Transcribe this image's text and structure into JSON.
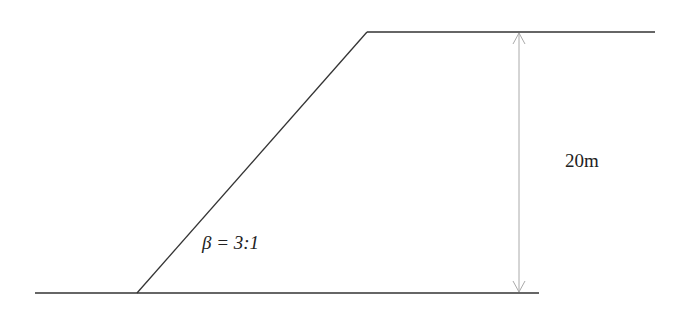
{
  "diagram": {
    "type": "embankment-cross-section",
    "labels": {
      "height": "20m",
      "slope": "β = 3:1"
    },
    "geometry": {
      "ground_line": {
        "x1": 35,
        "y1": 293,
        "x2": 539,
        "y2": 293
      },
      "slope_line": {
        "x1": 137,
        "y1": 293,
        "x2": 367,
        "y2": 32
      },
      "crest_line": {
        "x1": 367,
        "y1": 32,
        "x2": 655,
        "y2": 32
      },
      "dimension_line": {
        "x": 519,
        "y1": 32,
        "y2": 293
      }
    },
    "colors": {
      "outline": "#333333",
      "dimension": "#aaaaaa",
      "text": "#222222"
    }
  }
}
